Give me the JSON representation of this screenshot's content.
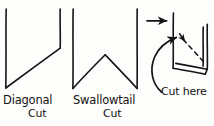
{
  "figure": {
    "title_present": false,
    "style": "hand-drawn ink sketch",
    "background_color": "#fdfdfb",
    "ink_color": "#141414"
  },
  "labels": {
    "diagonal_line1": "Diagonal",
    "diagonal_line2": "Cut",
    "swallowtail_line1": "Swallowtail",
    "swallowtail_line2": "Cut",
    "cut_here": "Cut here"
  },
  "diagrams": [
    {
      "id": "diagonal-cut",
      "name": "Diagonal Cut",
      "description": "Ribbon end cut on a single diagonal from lower-left to upper-right",
      "strokes": [
        {
          "type": "line",
          "name": "left-edge",
          "points": [
            [
              6,
              9
            ],
            [
              6,
              88
            ]
          ]
        },
        {
          "type": "line",
          "name": "diagonal-cut-edge",
          "points": [
            [
              6,
              88
            ],
            [
              60,
              48
            ]
          ]
        },
        {
          "type": "line",
          "name": "right-edge",
          "points": [
            [
              60,
              48
            ],
            [
              60,
              9
            ]
          ]
        }
      ]
    },
    {
      "id": "swallowtail-cut",
      "name": "Swallowtail Cut",
      "description": "Ribbon end cut into a V notch forming two points",
      "strokes": [
        {
          "type": "line",
          "name": "left-edge",
          "points": [
            [
              73,
              9
            ],
            [
              73,
              88
            ]
          ]
        },
        {
          "type": "line",
          "name": "notch-left",
          "points": [
            [
              73,
              88
            ],
            [
              105,
              55
            ]
          ]
        },
        {
          "type": "line",
          "name": "notch-right",
          "points": [
            [
              105,
              55
            ],
            [
              137,
              88
            ]
          ]
        },
        {
          "type": "line",
          "name": "right-edge",
          "points": [
            [
              137,
              88
            ],
            [
              137,
              9
            ]
          ]
        }
      ]
    },
    {
      "id": "cut-here-detail",
      "name": "Cut here detail",
      "description": "Perspective view of folded ribbon end with dashed cut guide line",
      "strokes": [
        {
          "type": "arrow",
          "name": "pointer-arrow",
          "points": [
            [
              147,
              21
            ],
            [
              168,
              21
            ]
          ]
        },
        {
          "type": "line",
          "name": "box-left-edge",
          "points": [
            [
              173,
              13
            ],
            [
              173,
              68
            ]
          ]
        },
        {
          "type": "line",
          "name": "box-front-bottom",
          "points": [
            [
              173,
              68
            ],
            [
              205,
              74
            ]
          ]
        },
        {
          "type": "line",
          "name": "box-back-bottom",
          "points": [
            [
              176,
              63
            ],
            [
              207,
              69
            ]
          ]
        },
        {
          "type": "line",
          "name": "box-bottom-right-join",
          "points": [
            [
              205,
              74
            ],
            [
              207,
              69
            ]
          ]
        },
        {
          "type": "line",
          "name": "box-right-edge",
          "points": [
            [
              207,
              69
            ],
            [
              207,
              24
            ]
          ]
        },
        {
          "type": "line",
          "name": "box-right-edge-inner",
          "points": [
            [
              203,
              27
            ],
            [
              203,
              66
            ]
          ]
        },
        {
          "type": "dashed",
          "name": "dashed-cut-guide",
          "points": [
            [
              183,
              39
            ],
            [
              205,
              63
            ]
          ]
        },
        {
          "type": "arrow",
          "name": "dashed-guide-arrowhead",
          "points": [
            [
              180,
              34
            ],
            [
              185,
              41
            ]
          ]
        },
        {
          "type": "curved-arrow",
          "name": "cut-here-callout-arrow",
          "points": [
            [
              160,
              90
            ],
            [
              152,
              66
            ],
            [
              163,
              47
            ],
            [
              178,
              37
            ]
          ]
        }
      ]
    }
  ]
}
